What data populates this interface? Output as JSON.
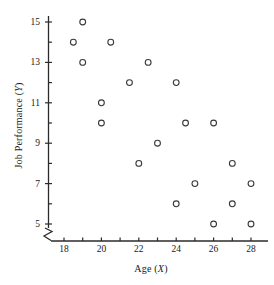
{
  "chart_data": {
    "type": "scatter",
    "title": "",
    "xlabel": "Age (X)",
    "ylabel": "Job Performance (Y)",
    "xlim": [
      17,
      28.8
    ],
    "ylim": [
      4.2,
      15.6
    ],
    "grid": false,
    "legend": null,
    "axis_break": true,
    "x_major_ticks": [
      18,
      20,
      22,
      24,
      26,
      28
    ],
    "x_minor_ticks": [
      19,
      21,
      23,
      25,
      27
    ],
    "y_major_ticks": [
      5,
      7,
      9,
      11,
      13,
      15
    ],
    "y_minor_ticks": [
      6,
      8,
      10,
      12,
      14
    ],
    "x_tick_labels": [
      "18",
      "20",
      "22",
      "24",
      "26",
      "28"
    ],
    "y_tick_labels": [
      "5",
      "7",
      "9",
      "11",
      "13",
      "15"
    ],
    "marker": "open-circle",
    "marker_color": "#3a3a3a",
    "n_points": 20,
    "points": [
      {
        "x": 19.0,
        "y": 15
      },
      {
        "x": 18.5,
        "y": 14
      },
      {
        "x": 20.5,
        "y": 14
      },
      {
        "x": 19.0,
        "y": 13
      },
      {
        "x": 22.5,
        "y": 13
      },
      {
        "x": 21.5,
        "y": 12
      },
      {
        "x": 24.0,
        "y": 12
      },
      {
        "x": 20.0,
        "y": 11
      },
      {
        "x": 20.0,
        "y": 10
      },
      {
        "x": 24.5,
        "y": 10
      },
      {
        "x": 26.0,
        "y": 10
      },
      {
        "x": 23.0,
        "y": 9
      },
      {
        "x": 22.0,
        "y": 8
      },
      {
        "x": 27.0,
        "y": 8
      },
      {
        "x": 25.0,
        "y": 7
      },
      {
        "x": 28.0,
        "y": 7
      },
      {
        "x": 24.0,
        "y": 6
      },
      {
        "x": 27.0,
        "y": 6
      },
      {
        "x": 26.0,
        "y": 5
      },
      {
        "x": 28.0,
        "y": 5
      }
    ]
  },
  "axis": {
    "x_title_main": "Age (",
    "x_title_var": "X",
    "x_title_end": ")",
    "y_title_main": "Job Performance (",
    "y_title_var": "Y",
    "y_title_end": ")"
  },
  "colors": {
    "axis": "#2b2b2b",
    "text": "#1a1a1a",
    "marker": "#3a3a3a",
    "background": "#ffffff"
  }
}
